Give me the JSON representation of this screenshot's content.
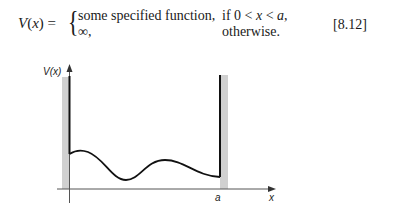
{
  "equation": {
    "lhs": "V(x) =",
    "lhs_var": "V",
    "lhs_arg": "(x)",
    "lhs_eq": " =",
    "brace": "{",
    "cases": [
      {
        "value": "some specified function,",
        "condition_prefix": "if 0 < ",
        "condition_var": "x",
        "condition_mid": " < ",
        "condition_var2": "a",
        "condition_suffix": ","
      },
      {
        "value": "∞,",
        "condition": "otherwise."
      }
    ],
    "number": "[8.12]"
  },
  "figure": {
    "y_axis_label": "V(x)",
    "x_axis_label": "x",
    "wall_label": "a",
    "colors": {
      "wall_band": "#d0d0d0",
      "line": "#111111",
      "axis": "#555555"
    }
  }
}
